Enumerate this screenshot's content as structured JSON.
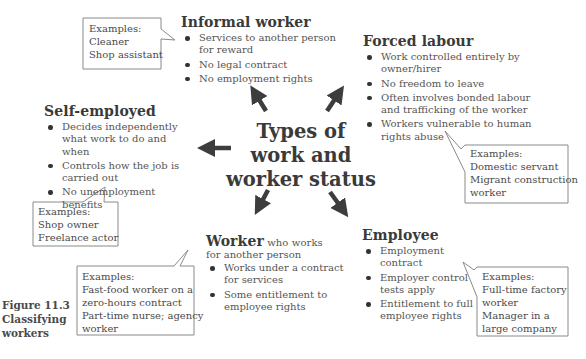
{
  "figure": {
    "label": "Figure 11.3",
    "caption_lines": [
      "Classifying",
      "workers"
    ]
  },
  "center": {
    "lines": [
      "Types of",
      "work and",
      "worker status"
    ]
  },
  "categories": {
    "informal": {
      "title": "Informal worker",
      "bullets": [
        "Services to another person for reward",
        "No legal contract",
        "No employment rights"
      ],
      "examples": [
        "Examples:",
        "Cleaner",
        "Shop assistant"
      ]
    },
    "forced": {
      "title": "Forced labour",
      "bullets": [
        "Work controlled entirely by owner/hirer",
        "No freedom to leave",
        "Often involves bonded labour and trafficking of the worker",
        "Workers vulnerable to human rights abuse"
      ],
      "examples": [
        "Examples:",
        "Domestic servant",
        "Migrant construction",
        "worker"
      ]
    },
    "self_employed": {
      "title": "Self-employed",
      "bullets": [
        "Decides independently what work to do and when",
        "Controls how the job is carried out",
        "No unemployment benefits"
      ],
      "examples": [
        "Examples:",
        "Shop owner",
        "Freelance actor"
      ]
    },
    "worker": {
      "title": "Worker",
      "title_suffix": " who works",
      "subtitle": "for another person",
      "bullets": [
        "Works under a contract for services",
        "Some entitlement to employee rights"
      ],
      "examples": [
        "Examples:",
        "Fast-food worker on a",
        "zero-hours contract",
        "Part-time nurse; agency",
        "worker"
      ]
    },
    "employee": {
      "title": "Employee",
      "bullets": [
        "Employment contract",
        "Employer control tests apply",
        "Entitlement to full employee rights"
      ],
      "examples": [
        "Examples:",
        "Full-time factory",
        "worker",
        "Manager in a",
        "large company"
      ]
    }
  },
  "colors": {
    "arrow": "#3d3d3d",
    "heading": "#3a3a3a",
    "body_text": "#555555",
    "callout_border": "#8a8a8a"
  }
}
